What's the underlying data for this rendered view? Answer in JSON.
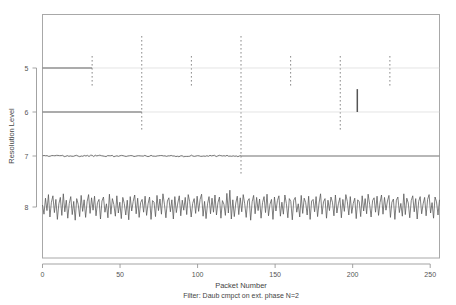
{
  "chart_data": {
    "type": "line",
    "title": "Wavelet Packet Decomposition",
    "xlabel": "Packet Number",
    "ylabel": "Resolution Level",
    "caption": "Filter:  Daub cmpct on ext. phase N=2",
    "xlim": [
      0,
      256
    ],
    "ylim_levels": [
      5,
      6,
      7,
      8
    ],
    "x_ticks": [
      0,
      50,
      100,
      150,
      200,
      250
    ],
    "x_tick_labels": [
      "0",
      "50",
      "100",
      "150",
      "200",
      "250"
    ],
    "y_ticks": [
      5,
      6,
      7,
      8
    ],
    "y_tick_labels": [
      "5",
      "6",
      "7",
      "8"
    ],
    "grid": false,
    "legend": "none",
    "packet_boundaries": [
      32,
      64,
      96,
      128,
      160,
      192,
      224
    ],
    "boundary_style": "dotted",
    "boundary_color": "#8a8a8a",
    "trace_color": "#555555",
    "axis_color": "#999999",
    "background": "#ffffff",
    "series": [
      {
        "name": "level-5",
        "level": 5,
        "baseline_segment": [
          0,
          32
        ],
        "description": "solid horizontal segment from packet 0 to 32 at level 5, flat thereafter",
        "values": []
      },
      {
        "name": "level-6",
        "level": 6,
        "baseline_segment": [
          0,
          64
        ],
        "description": "solid horizontal segment from packet 0 to 64 at level 6, flat after; isolated tall spike near packet 203",
        "spike": {
          "x": 203,
          "height": 0.52
        },
        "values": []
      },
      {
        "name": "level-7",
        "level": 7,
        "baseline_segment": [
          0,
          128
        ],
        "description": "low-amplitude wiggle from packet 0 to 128 at level 7, flat after",
        "values": [
          0.02,
          -0.01,
          0.03,
          0.0,
          -0.02,
          0.02,
          0.01,
          -0.03,
          0.02,
          0.0,
          0.03,
          -0.01,
          0.02,
          0.01,
          -0.02,
          0.03,
          0.0,
          -0.01,
          0.02,
          0.02,
          -0.03,
          0.01,
          0.0,
          0.02,
          -0.02,
          0.03,
          0.01,
          -0.01,
          0.02,
          0.0,
          -0.02,
          0.03
        ]
      },
      {
        "name": "level-8",
        "level": 8,
        "baseline_segment": [
          0,
          256
        ],
        "description": "dense high-frequency noise trace spanning all 256 packets at level 8",
        "amplitude": 0.34,
        "values": [
          0.05,
          -0.18,
          0.22,
          -0.09,
          0.31,
          -0.25,
          0.12,
          0.28,
          -0.14,
          0.19,
          -0.31,
          0.08,
          0.24,
          -0.21,
          0.33,
          -0.12,
          0.17,
          -0.28,
          0.09,
          0.26,
          -0.19,
          0.14,
          -0.33,
          0.21,
          0.07,
          -0.24,
          0.29,
          -0.11,
          0.18,
          -0.26,
          0.13,
          0.31,
          -0.16,
          0.23,
          -0.08,
          0.27,
          -0.22,
          0.11,
          0.19,
          -0.3,
          0.15,
          0.25,
          -0.13,
          0.08,
          -0.27,
          0.32,
          -0.18,
          0.21,
          0.06,
          -0.23,
          0.28,
          -0.15,
          0.12,
          -0.29,
          0.24,
          0.09,
          -0.2,
          0.17,
          -0.32,
          0.26,
          -0.1,
          0.14,
          0.3,
          -0.17,
          0.22,
          -0.26,
          0.11,
          0.19,
          -0.13,
          0.27,
          -0.21,
          0.08,
          0.25,
          -0.31,
          0.16,
          0.12,
          -0.24,
          0.29,
          -0.09,
          0.2,
          -0.18,
          0.33,
          0.07,
          -0.27,
          0.15,
          0.23,
          -0.12,
          0.18,
          -0.3,
          0.26,
          -0.14,
          0.1,
          0.28,
          -0.22,
          0.17,
          -0.08,
          0.24,
          -0.19,
          0.31,
          0.13,
          -0.25,
          0.09,
          0.21,
          -0.16,
          0.27,
          -0.11,
          0.19,
          0.32,
          -0.23,
          0.14,
          -0.29,
          0.08,
          0.26,
          -0.17,
          0.22,
          -0.13,
          0.3,
          -0.2,
          0.11,
          0.25,
          -0.28,
          0.16,
          0.07,
          -0.21,
          0.34,
          -0.15,
          0.42,
          -0.3,
          0.18,
          -0.24,
          0.1,
          0.27,
          -0.19,
          0.23,
          -0.12,
          0.31,
          0.08,
          -0.26,
          0.15,
          0.21,
          -0.33,
          0.13,
          0.29,
          -0.17,
          0.24,
          -0.09,
          0.2,
          -0.28,
          0.11,
          0.26,
          -0.14,
          0.32,
          -0.22,
          0.07,
          0.19,
          -0.31,
          0.25,
          -0.1,
          0.16,
          0.28,
          -0.23,
          0.12,
          -0.18,
          0.3,
          0.09,
          -0.27,
          0.21,
          0.14,
          -0.32,
          0.17,
          0.24,
          -0.13,
          0.08,
          -0.25,
          0.29,
          -0.16,
          0.22,
          0.11,
          -0.2,
          0.27,
          -0.31,
          0.15,
          0.19,
          -0.12,
          0.26,
          -0.24,
          0.1,
          0.33,
          -0.18,
          0.13,
          0.21,
          -0.28,
          0.17,
          -0.09,
          0.25,
          0.12,
          -0.22,
          0.3,
          -0.15,
          0.08,
          0.23,
          -0.27,
          0.19,
          -0.11,
          0.31,
          0.14,
          -0.2,
          0.26,
          -0.16,
          0.09,
          0.22,
          -0.29,
          0.18,
          0.13,
          -0.24,
          0.28,
          -0.1,
          0.21,
          -0.17,
          0.32,
          0.07,
          -0.25,
          0.16,
          0.23,
          -0.13,
          0.27,
          -0.21,
          0.11,
          0.3,
          -0.18,
          0.24,
          -0.08,
          0.15,
          0.29,
          -0.26,
          0.12,
          0.2,
          -0.31,
          0.17,
          0.25,
          -0.14,
          0.09,
          -0.23,
          0.33,
          -0.19,
          0.22,
          0.1,
          -0.27,
          0.16,
          0.28,
          -0.12,
          0.21,
          -0.3,
          0.14,
          0.26,
          -0.17,
          0.08,
          0.24,
          -0.22,
          0.19,
          0.31,
          -0.15,
          0.11,
          -0.28,
          0.25,
          0.13,
          -0.2,
          0.18
        ]
      }
    ]
  }
}
